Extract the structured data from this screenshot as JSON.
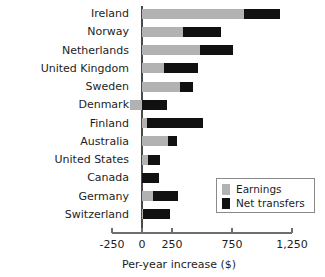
{
  "chart_data": {
    "type": "bar",
    "orientation": "horizontal",
    "stacked": true,
    "title": "",
    "xlabel": "Per-year increase ($)",
    "ylabel": "",
    "xlim": [
      -250,
      1250
    ],
    "xticks": [
      -250,
      0,
      250,
      750,
      1250
    ],
    "xtick_labels": [
      "-250",
      "0",
      "250",
      "750",
      "1,250"
    ],
    "grid": false,
    "legend_position": "lower-right",
    "categories": [
      "Ireland",
      "Norway",
      "Netherlands",
      "United Kingdom",
      "Sweden",
      "Denmark",
      "Finland",
      "Australia",
      "United States",
      "Canada",
      "Germany",
      "Switzerland"
    ],
    "series": [
      {
        "name": "Earnings",
        "color": "#b2b2b2",
        "values": [
          850,
          345,
          480,
          185,
          315,
          -100,
          40,
          220,
          50,
          0,
          95,
          10
        ]
      },
      {
        "name": "Net transfers",
        "color": "#111111",
        "values": [
          300,
          315,
          275,
          280,
          110,
          205,
          470,
          75,
          100,
          140,
          205,
          220
        ]
      }
    ],
    "totals": [
      1150,
      660,
      755,
      465,
      425,
      205,
      510,
      295,
      150,
      140,
      300,
      230
    ]
  },
  "legend": {
    "items": [
      {
        "label": "Earnings",
        "color": "#b2b2b2"
      },
      {
        "label": "Net transfers",
        "color": "#111111"
      }
    ]
  },
  "axis": {
    "title": "Per-year increase ($)"
  }
}
